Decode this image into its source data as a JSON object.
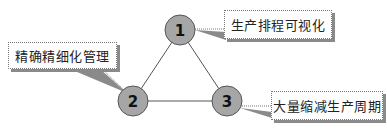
{
  "nodes": [
    {
      "id": "1",
      "label": "1",
      "callout": "生产排程可视化"
    },
    {
      "id": "2",
      "label": "2",
      "callout": "精确精细化管理"
    },
    {
      "id": "3",
      "label": "3",
      "callout": "大量缩减生产周期"
    }
  ],
  "colors": {
    "node_fill": "#a6a6a6",
    "node_stroke": "#555555",
    "edge": "#555555",
    "callout_border": "#777777",
    "callout_shadow": "#8a8a8a"
  }
}
